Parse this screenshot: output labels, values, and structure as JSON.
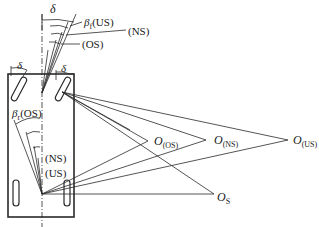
{
  "figure": {
    "type": "vehicle steering geometry diagram (oversteer/neutral steer/understeer turning centers)",
    "labels": {
      "delta_top": "δ",
      "delta_left_wheel": "δ",
      "delta_right_wheel": "δ",
      "beta_f_symbol": "β",
      "beta_f_sub": "f",
      "beta_f_case": "(US)",
      "front_ns": "(NS)",
      "front_os": "(OS)",
      "beta_r_symbol": "β",
      "beta_r_sub": "r",
      "beta_r_case": "(OS)",
      "rear_ns": "(NS)",
      "rear_us": "(US)",
      "o_os_main": "O",
      "o_os_sub": "(OS)",
      "o_ns_main": "O",
      "o_ns_sub": "(NS)",
      "o_us_main": "O",
      "o_us_sub": "(US)",
      "o_s_main": "O",
      "o_s_sub": "S"
    },
    "turning_centers": [
      {
        "name": "O(OS)",
        "x": 148,
        "y": 141
      },
      {
        "name": "O(NS)",
        "x": 206,
        "y": 140
      },
      {
        "name": "O(US)",
        "x": 288,
        "y": 140
      },
      {
        "name": "OS",
        "x": 214,
        "y": 194
      }
    ],
    "colors": {
      "line": "#2a2a2a",
      "background": "#ffffff"
    }
  }
}
